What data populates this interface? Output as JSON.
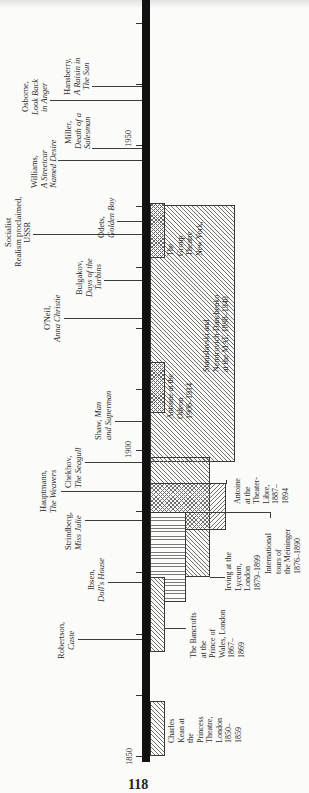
{
  "page": {
    "page_number": "118"
  },
  "axis": {
    "year_1850": "1850",
    "year_1900": "1900",
    "year_1950": "1950"
  },
  "events": [
    {
      "id": "robertson",
      "author": "Robertson,\n",
      "title": "Caste"
    },
    {
      "id": "ibsen",
      "author": "Ibsen,\n",
      "title": "Doll's House"
    },
    {
      "id": "strindberg",
      "author": "Strindberg,\n",
      "title": "Miss Julie"
    },
    {
      "id": "hauptmann",
      "author": "Hauptmann,\n",
      "title": "The Weavers"
    },
    {
      "id": "chekhov",
      "author": "Chekhov,\n",
      "title": "The Seagull"
    },
    {
      "id": "shaw",
      "author": "Shaw, ",
      "title": "Man\nand Superman"
    },
    {
      "id": "oneil",
      "author": "O'Neil,\n",
      "title": "Anna Christie"
    },
    {
      "id": "bulgakov",
      "author": "Bulgakov,\n",
      "title": "Days of the\nTurbins"
    },
    {
      "id": "socialist",
      "author": "Socialist\nRealism proclaimed,\nUSSR",
      "title": ""
    },
    {
      "id": "odets",
      "author": "Odets,\n",
      "title": "Golden Boy"
    },
    {
      "id": "williams",
      "author": "Williams,\n",
      "title": "A Streetcar\nNamed Desire"
    },
    {
      "id": "miller",
      "author": "Miller,\n",
      "title": "Death of a\nSalesman"
    },
    {
      "id": "osborne",
      "author": "Osborne,\n",
      "title": "Look Back\nin Anger"
    },
    {
      "id": "hansberry",
      "author": "Hansberry,\n",
      "title": "A Raisin in\nThe Sun"
    }
  ],
  "periods": [
    {
      "id": "kean",
      "label": "Charles\nKean at\nthe\nPrincess\nTheatre,\nLondon\n1850–\n1859"
    },
    {
      "id": "bancrofts",
      "label": "The Bancrofts\nat the\nPrince of\nWales, London\n1867–\n1869"
    },
    {
      "id": "meininger",
      "label": "International\ntours of\nthe Meininger\n1876–1890"
    },
    {
      "id": "irving",
      "label": "Irving at the\nLyceum,\nLondon\n1879–1899"
    },
    {
      "id": "antoine_libre",
      "label": "Antoine\nat the\nTheater-\nLibre,\n1887–\n1894"
    },
    {
      "id": "mat",
      "label": "Stanislavski and\nNemirovich-Danchenko\nat the MAT, 1898–1940"
    },
    {
      "id": "antoine_odeon",
      "label": "Antoine at the\nOdeon\n1906–1914"
    },
    {
      "id": "group",
      "label": "The\nGroup\nTheatre\nNew York,"
    }
  ],
  "colors": {
    "spine": "#111111",
    "ink": "#2b2b2b",
    "hatch": "#707070",
    "paper": "#fbfbfa"
  }
}
